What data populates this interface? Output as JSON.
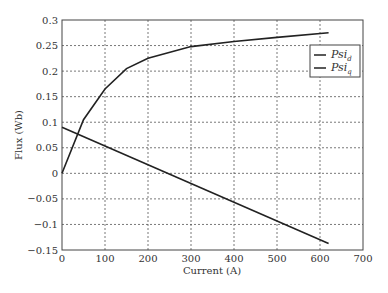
{
  "chart_data": {
    "type": "line",
    "title": "",
    "xlabel": "Current (A)",
    "ylabel": "Flux (Wb)",
    "xlim": [
      0,
      700
    ],
    "ylim": [
      -0.15,
      0.3
    ],
    "xticks": [
      "0",
      "100",
      "200",
      "300",
      "400",
      "500",
      "600",
      "700"
    ],
    "yticks": [
      "0.3",
      "0.25",
      "0.2",
      "0.15",
      "0.1",
      "0.05",
      "0",
      "-0.05",
      "-0.1",
      "-0.15"
    ],
    "grid": true,
    "legend_position": "upper right",
    "series": [
      {
        "name": "Psi_d",
        "x": [
          0,
          50,
          100,
          150,
          200,
          300,
          400,
          500,
          620
        ],
        "y": [
          0,
          0.105,
          0.165,
          0.205,
          0.225,
          0.248,
          0.258,
          0.266,
          0.275
        ]
      },
      {
        "name": "Psi_q",
        "x": [
          0,
          620
        ],
        "y": [
          0.09,
          -0.137
        ]
      }
    ]
  },
  "legend": {
    "items": [
      {
        "main": "Psi",
        "sub": "d"
      },
      {
        "main": "Psi",
        "sub": "q"
      }
    ]
  },
  "axes": {
    "xlabel": "Current (A)",
    "ylabel": "Flux (Wb)"
  }
}
